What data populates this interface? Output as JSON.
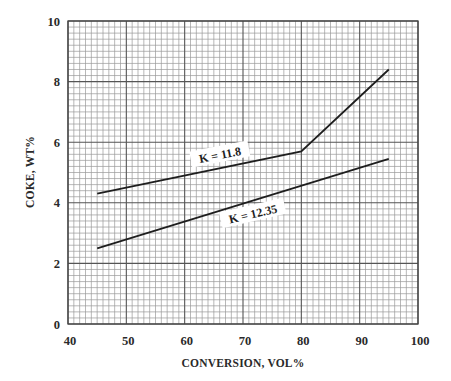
{
  "chart_data": {
    "type": "line",
    "title": "",
    "xlabel": "CONVERSION, VOL%",
    "ylabel": "COKE, WT%",
    "xlim": [
      40,
      100
    ],
    "ylim": [
      0,
      10
    ],
    "x_ticks": [
      40,
      50,
      60,
      70,
      80,
      90,
      100
    ],
    "y_ticks": [
      0,
      2,
      4,
      6,
      8,
      10
    ],
    "x_tick_labels": [
      "40",
      "50",
      "60",
      "70",
      "80",
      "90",
      "100"
    ],
    "y_tick_labels": [
      "0",
      "2",
      "4",
      "6",
      "8",
      "10"
    ],
    "grid": {
      "on": true,
      "major_x_step": 10,
      "minor_x_step": 1,
      "major_y_step": 2,
      "minor_y_step": 0.2
    },
    "legend": "none (inline curve labels)",
    "series": [
      {
        "name": "K = 11.8",
        "label": "K = 11.8",
        "x": [
          45,
          80,
          95
        ],
        "y": [
          4.3,
          5.7,
          8.4
        ]
      },
      {
        "name": "K = 12.35",
        "label": "K = 12.35",
        "x": [
          45,
          95
        ],
        "y": [
          2.5,
          5.45
        ]
      }
    ],
    "annotations": [
      {
        "text": "K = 11.8",
        "x": 63,
        "y": 5.5,
        "position": "above curve"
      },
      {
        "text": "K = 12.35",
        "x": 72,
        "y": 3.6,
        "position": "below curve"
      }
    ]
  },
  "colors": {
    "background": "#ffffff",
    "minor_grid": "#9a9a9a",
    "major_grid": "#555555",
    "curve": "#1e1e1e",
    "text": "#2a2a2a"
  }
}
